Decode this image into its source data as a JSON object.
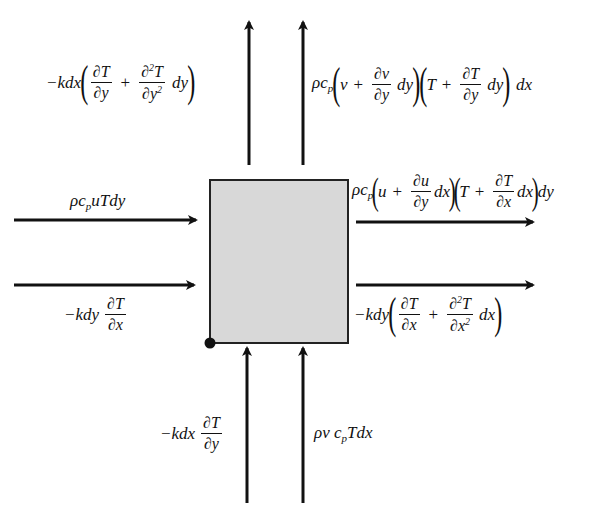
{
  "diagram": {
    "title": "",
    "control_volume": {
      "shape": "rectangle",
      "fill_color": "#d8d8d8",
      "border_color": "#222222",
      "origin_marker": "filled-dot-bottom-left"
    },
    "labels": {
      "top_left": {
        "prefix": "−kdx",
        "term1_num": "∂T",
        "term1_den": "∂y",
        "plus": "+",
        "term2_num_base": "∂",
        "term2_num_sup": "2",
        "term2_num_tail": "T",
        "term2_den_base": "∂y",
        "term2_den_sup": "2",
        "suffix": "dy"
      },
      "top_right": {
        "prefix_rho": "ρc",
        "prefix_sub": "p",
        "a_var": "v",
        "plus1": "+",
        "a_num": "∂v",
        "a_den": "∂y",
        "a_suffix": "dy",
        "b_var": "T",
        "plus2": "+",
        "b_num": "∂T",
        "b_den": "∂y",
        "b_suffix": "dy",
        "tail": "dx"
      },
      "left_top": {
        "rho": "ρc",
        "sub": "p",
        "rest": "uTdy"
      },
      "left_bottom": {
        "prefix": "−kdy",
        "num": "∂T",
        "den": "∂x"
      },
      "right_top": {
        "prefix_rho": "ρc",
        "prefix_sub": "p",
        "a_var": "u",
        "plus1": "+",
        "a_num": "∂u",
        "a_den": "∂y",
        "a_suffix": "dx",
        "b_var": "T",
        "plus2": "+",
        "b_num": "∂T",
        "b_den": "∂x",
        "b_suffix": "dx",
        "tail": "dy"
      },
      "right_bottom": {
        "prefix": "−kdy",
        "term1_num": "∂T",
        "term1_den": "∂x",
        "plus": "+",
        "term2_num_base": "∂",
        "term2_num_sup": "2",
        "term2_num_tail": "T",
        "term2_den_base": "∂x",
        "term2_den_sup": "2",
        "suffix": "dx"
      },
      "bottom_left": {
        "prefix": "−kdx",
        "num": "∂T",
        "den": "∂y"
      },
      "bottom_right": {
        "rho": "ρv c",
        "sub": "p",
        "rest": "Tdx"
      }
    },
    "arrows": [
      {
        "id": "top-left-arrow",
        "direction": "up"
      },
      {
        "id": "top-right-arrow",
        "direction": "up"
      },
      {
        "id": "left-top-arrow",
        "direction": "right"
      },
      {
        "id": "left-bottom-arrow",
        "direction": "right"
      },
      {
        "id": "right-top-arrow",
        "direction": "right"
      },
      {
        "id": "right-bottom-arrow",
        "direction": "right"
      },
      {
        "id": "bottom-left-arrow",
        "direction": "up"
      },
      {
        "id": "bottom-right-arrow",
        "direction": "up"
      }
    ],
    "colors": {
      "stroke": "#111111",
      "box_fill": "#d8d8d8"
    }
  }
}
